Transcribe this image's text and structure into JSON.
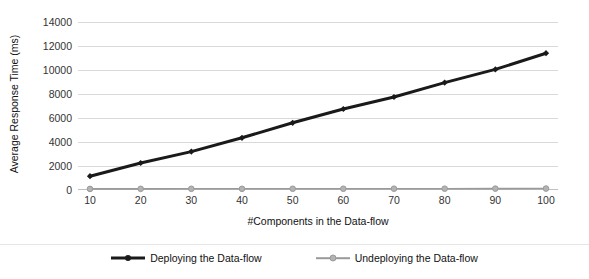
{
  "chart_data": {
    "type": "line",
    "title": "",
    "xlabel": "#Components in the Data-flow",
    "ylabel": "Average Response Time (ms)",
    "categories": [
      10,
      20,
      30,
      40,
      50,
      60,
      70,
      80,
      90,
      100
    ],
    "x": [
      10,
      20,
      30,
      40,
      50,
      60,
      70,
      80,
      90,
      100
    ],
    "xtick_labels": [
      "10",
      "20",
      "30",
      "40",
      "50",
      "60",
      "70",
      "80",
      "90",
      "100"
    ],
    "ytick_labels": [
      "0",
      "2000",
      "4000",
      "6000",
      "8000",
      "10000",
      "12000",
      "14000"
    ],
    "yticks": [
      0,
      2000,
      4000,
      6000,
      8000,
      10000,
      12000,
      14000
    ],
    "ylim": [
      0,
      14000
    ],
    "xlim": [
      10,
      100
    ],
    "grid": "horizontal",
    "legend_position": "bottom-center",
    "series": [
      {
        "name": "Deploying the Data-flow",
        "color": "#1a1a1a",
        "line_width": 3,
        "marker": "diamond",
        "values": [
          1150,
          2250,
          3200,
          4350,
          5600,
          6750,
          7750,
          8950,
          10050,
          11400
        ]
      },
      {
        "name": "Undeploying the Data-flow",
        "color": "#9a9a9a",
        "line_width": 1.6,
        "marker": "circle",
        "values": [
          90,
          95,
          100,
          100,
          105,
          105,
          110,
          110,
          115,
          120
        ]
      }
    ]
  },
  "axes": {
    "y_title": "Average Response Time (ms)",
    "x_title": "#Components in the Data-flow"
  },
  "legend": {
    "items": [
      {
        "label": "Deploying the Data-flow",
        "color": "#1a1a1a"
      },
      {
        "label": "Undeploying the Data-flow",
        "color": "#9a9a9a"
      }
    ]
  },
  "colors": {
    "gridline": "#d9d9d9",
    "baseline": "#bfbfbf",
    "series_1": "#1a1a1a",
    "series_2": "#9a9a9a",
    "text": "#111111",
    "background": "#ffffff"
  }
}
